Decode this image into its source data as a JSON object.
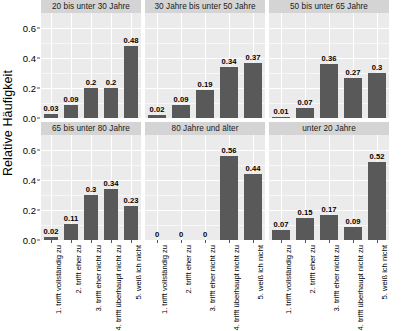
{
  "chart_data": {
    "type": "bar",
    "title": "",
    "subtitle": "",
    "xlabel": "",
    "ylabel": "Relative Häufigkeit",
    "ylim": [
      0,
      0.7
    ],
    "y_ticks": [
      "0.0",
      "0.2",
      "0.4",
      "0.6"
    ],
    "y_tick_values": [
      0.0,
      0.2,
      0.4,
      0.6
    ],
    "grid": true,
    "legend": "none",
    "facet_layout": "2 rows x 3 columns",
    "categories": [
      "1. trifft vollständig zu",
      "2. trifft eher zu",
      "3. trifft eher nicht zu",
      "4. trifft überhaupt nicht zu",
      "5. weiß ich nicht"
    ],
    "panels": [
      {
        "title": "20 bis unter 30 Jahre",
        "values": [
          0.03,
          0.09,
          0.2,
          0.2,
          0.48
        ],
        "labels": [
          "0.03",
          "0.09",
          "0.2",
          "0.2",
          "0.48"
        ]
      },
      {
        "title": "30 Jahre bis unter 50 Jahre",
        "values": [
          0.02,
          0.09,
          0.19,
          0.34,
          0.37
        ],
        "labels": [
          "0.02",
          "0.09",
          "0.19",
          "0.34",
          "0.37"
        ]
      },
      {
        "title": "50 bis unter 65 Jahre",
        "values": [
          0.01,
          0.07,
          0.36,
          0.27,
          0.3
        ],
        "labels": [
          "0.01",
          "0.07",
          "0.36",
          "0.27",
          "0.3"
        ]
      },
      {
        "title": "65 bis unter 80 Jahre",
        "values": [
          0.02,
          0.11,
          0.3,
          0.34,
          0.23
        ],
        "labels": [
          "0.02",
          "0.11",
          "0.3",
          "0.34",
          "0.23"
        ]
      },
      {
        "title": "80 Jahre und älter",
        "values": [
          0,
          0,
          0,
          0.56,
          0.44
        ],
        "labels": [
          "0",
          "0",
          "0",
          "0.56",
          "0.44"
        ]
      },
      {
        "title": "unter 20 Jahre",
        "values": [
          0.07,
          0.15,
          0.17,
          0.09,
          0.52
        ],
        "labels": [
          "0.07",
          "0.15",
          "0.17",
          "0.09",
          "0.52"
        ]
      }
    ]
  },
  "colors": {
    "bar": "#595959",
    "panel_background": "#ebebeb",
    "strip_background": "#d4d4d4",
    "gridline": "#ffffff",
    "text": "#000000",
    "page_background": "#ffffff"
  }
}
